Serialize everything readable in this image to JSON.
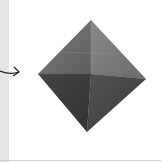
{
  "image": {
    "subject": "origami octahedron",
    "annotation": "arrow pointing right",
    "colors": {
      "background": "#ffffff",
      "left_strip": "#e6e6e6",
      "face_top_left": "#6b6b6b",
      "face_top_right": "#7a7a7a",
      "face_bottom_left": "#3e3e3e",
      "face_bottom_right": "#4a4a4a",
      "arrow": "#222222"
    }
  }
}
